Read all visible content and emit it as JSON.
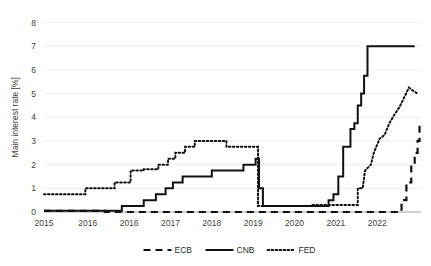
{
  "chart_data": {
    "type": "line",
    "title": "",
    "xlabel": "",
    "ylabel": "Main interest rate [%]",
    "ylim": [
      0,
      8
    ],
    "yticks": [
      0,
      1,
      2,
      3,
      4,
      5,
      6,
      7,
      8
    ],
    "ytick_labels": [
      "0",
      "1",
      "2",
      "3",
      "4",
      "5",
      "6",
      "7",
      "8"
    ],
    "xlim": [
      2015.0,
      2022.75
    ],
    "xticks": [
      2015.0,
      2015.9,
      2016.75,
      2017.6,
      2018.45,
      2019.3,
      2020.15,
      2021.0,
      2021.85
    ],
    "xtick_labels": [
      "2015",
      "2016",
      "2016",
      "2017",
      "2018",
      "2019",
      "2020",
      "2021",
      "2022"
    ],
    "grid": true,
    "grid_axis": "y",
    "legend_position": "bottom",
    "line_color": "#111111",
    "series": [
      {
        "name": "ECB",
        "style": "dashed",
        "points": [
          [
            2015.0,
            0.05
          ],
          [
            2016.25,
            0.05
          ],
          [
            2016.25,
            0.0
          ],
          [
            2022.35,
            0.0
          ],
          [
            2022.35,
            0.5
          ],
          [
            2022.45,
            0.5
          ],
          [
            2022.45,
            1.25
          ],
          [
            2022.55,
            1.25
          ],
          [
            2022.55,
            2.0
          ],
          [
            2022.62,
            2.0
          ],
          [
            2022.62,
            2.5
          ],
          [
            2022.68,
            2.5
          ],
          [
            2022.68,
            3.0
          ],
          [
            2022.72,
            3.0
          ],
          [
            2022.72,
            3.75
          ],
          [
            2022.75,
            3.75
          ]
        ]
      },
      {
        "name": "CNB",
        "style": "solid",
        "points": [
          [
            2015.0,
            0.05
          ],
          [
            2016.6,
            0.05
          ],
          [
            2016.6,
            0.25
          ],
          [
            2017.05,
            0.25
          ],
          [
            2017.05,
            0.5
          ],
          [
            2017.3,
            0.5
          ],
          [
            2017.3,
            0.75
          ],
          [
            2017.5,
            0.75
          ],
          [
            2017.5,
            1.0
          ],
          [
            2017.65,
            1.0
          ],
          [
            2017.65,
            1.25
          ],
          [
            2017.85,
            1.25
          ],
          [
            2017.85,
            1.5
          ],
          [
            2018.45,
            1.5
          ],
          [
            2018.45,
            1.75
          ],
          [
            2019.1,
            1.75
          ],
          [
            2019.1,
            2.0
          ],
          [
            2019.35,
            2.0
          ],
          [
            2019.35,
            2.25
          ],
          [
            2019.42,
            2.25
          ],
          [
            2019.42,
            1.0
          ],
          [
            2019.5,
            1.0
          ],
          [
            2019.5,
            0.25
          ],
          [
            2020.85,
            0.25
          ],
          [
            2020.85,
            0.5
          ],
          [
            2020.95,
            0.5
          ],
          [
            2020.95,
            0.75
          ],
          [
            2021.05,
            0.75
          ],
          [
            2021.05,
            1.5
          ],
          [
            2021.15,
            1.5
          ],
          [
            2021.15,
            2.75
          ],
          [
            2021.3,
            2.75
          ],
          [
            2021.3,
            3.5
          ],
          [
            2021.38,
            3.5
          ],
          [
            2021.38,
            3.75
          ],
          [
            2021.45,
            3.75
          ],
          [
            2021.45,
            4.5
          ],
          [
            2021.52,
            4.5
          ],
          [
            2021.52,
            5.0
          ],
          [
            2021.58,
            5.0
          ],
          [
            2021.58,
            5.75
          ],
          [
            2021.65,
            5.75
          ],
          [
            2021.65,
            7.0
          ],
          [
            2022.62,
            7.0
          ]
        ]
      },
      {
        "name": "FED",
        "style": "dotted",
        "points": [
          [
            2015.0,
            0.75
          ],
          [
            2015.85,
            0.75
          ],
          [
            2015.85,
            1.0
          ],
          [
            2016.45,
            1.0
          ],
          [
            2016.45,
            1.25
          ],
          [
            2016.78,
            1.25
          ],
          [
            2016.78,
            1.75
          ],
          [
            2017.05,
            1.75
          ],
          [
            2017.05,
            1.8
          ],
          [
            2017.35,
            1.8
          ],
          [
            2017.35,
            2.0
          ],
          [
            2017.55,
            2.0
          ],
          [
            2017.55,
            2.25
          ],
          [
            2017.7,
            2.25
          ],
          [
            2017.7,
            2.5
          ],
          [
            2017.9,
            2.5
          ],
          [
            2017.9,
            2.75
          ],
          [
            2018.1,
            2.75
          ],
          [
            2018.1,
            3.0
          ],
          [
            2018.75,
            3.0
          ],
          [
            2018.75,
            2.75
          ],
          [
            2019.4,
            2.75
          ],
          [
            2019.4,
            0.25
          ],
          [
            2020.5,
            0.25
          ],
          [
            2020.5,
            0.3
          ],
          [
            2021.45,
            0.3
          ],
          [
            2021.45,
            1.0
          ],
          [
            2021.55,
            1.0
          ],
          [
            2021.6,
            1.75
          ],
          [
            2021.72,
            2.0
          ],
          [
            2021.78,
            2.5
          ],
          [
            2021.9,
            3.1
          ],
          [
            2022.0,
            3.25
          ],
          [
            2022.1,
            3.75
          ],
          [
            2022.2,
            4.1
          ],
          [
            2022.3,
            4.4
          ],
          [
            2022.42,
            4.9
          ],
          [
            2022.5,
            5.25
          ],
          [
            2022.6,
            5.1
          ],
          [
            2022.68,
            5.0
          ]
        ]
      }
    ],
    "legend": [
      {
        "label": "ECB",
        "style": "dashed"
      },
      {
        "label": "CNB",
        "style": "solid"
      },
      {
        "label": "FED",
        "style": "dotted"
      }
    ]
  }
}
